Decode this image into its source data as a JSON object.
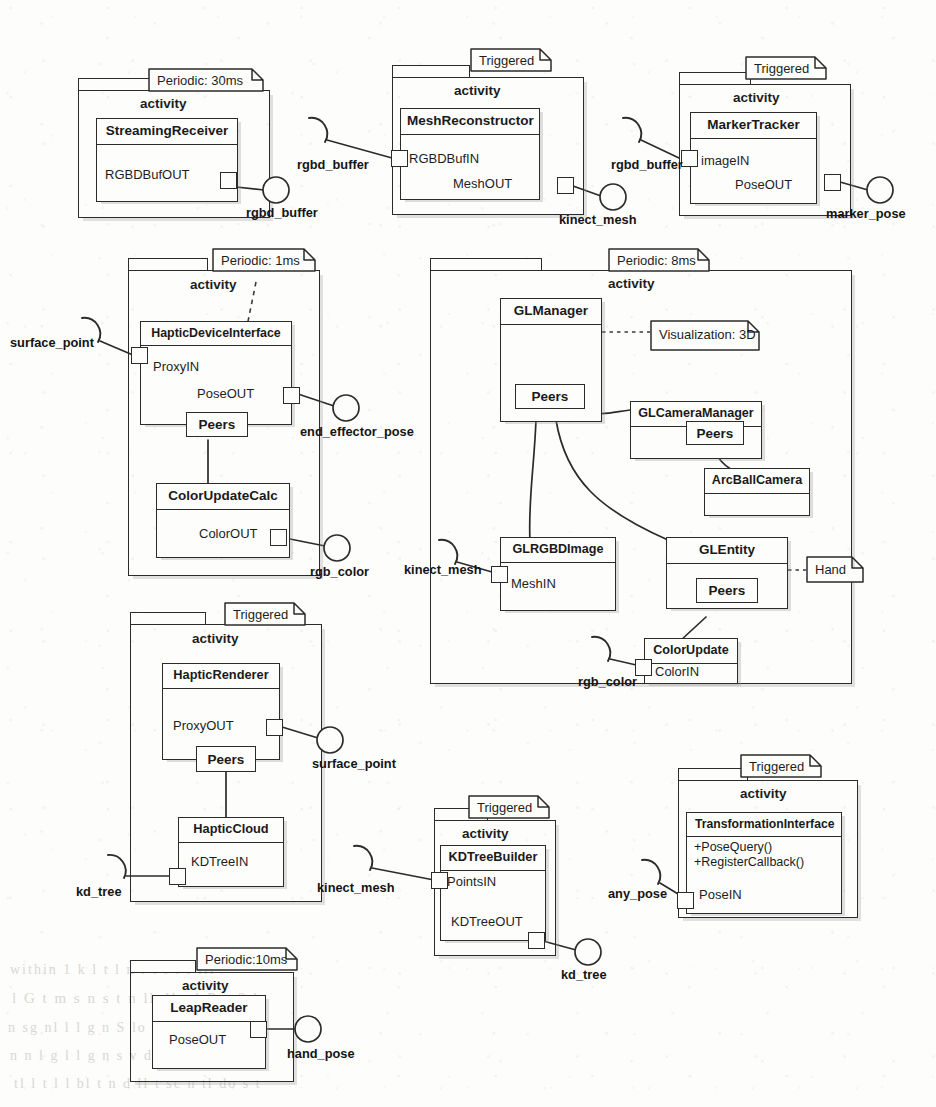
{
  "diagram": {
    "stereotype_label": "activity",
    "colors": {
      "line": "#2b2b2b",
      "text": "#1a1a1a",
      "paper": "#fdfdfc",
      "shadow": "#969696"
    }
  },
  "notes": {
    "periodic_30ms": "Periodic: 30ms",
    "triggered_mesh": "Triggered",
    "triggered_marker": "Triggered",
    "periodic_1ms": "Periodic: 1ms",
    "periodic_8ms": "Periodic: 8ms",
    "triggered_haptic": "Triggered",
    "triggered_kdtree": "Triggered",
    "triggered_transform": "Triggered",
    "periodic_10ms": "Periodic:10ms",
    "visualization_3d": "Visualization: 3D",
    "hand": "Hand"
  },
  "packages": [
    {
      "id": "pkg_streaming",
      "label": "activity"
    },
    {
      "id": "pkg_mesh",
      "label": "activity"
    },
    {
      "id": "pkg_marker",
      "label": "activity"
    },
    {
      "id": "pkg_haptic_dev",
      "label": "activity"
    },
    {
      "id": "pkg_gl",
      "label": "activity"
    },
    {
      "id": "pkg_haptic_rend",
      "label": "activity"
    },
    {
      "id": "pkg_kdtree",
      "label": "activity"
    },
    {
      "id": "pkg_transform",
      "label": "activity"
    },
    {
      "id": "pkg_leap",
      "label": "activity"
    }
  ],
  "classes": {
    "streaming_receiver": {
      "name": "StreamingReceiver",
      "ports": [
        "RGBDBufOUT"
      ]
    },
    "mesh_reconstructor": {
      "name": "MeshReconstructor",
      "ports": [
        "RGBDBufIN",
        "MeshOUT"
      ]
    },
    "marker_tracker": {
      "name": "MarkerTracker",
      "ports": [
        "imageIN",
        "PoseOUT"
      ]
    },
    "haptic_device_interface": {
      "name": "HapticDeviceInterface",
      "ports": [
        "ProxyIN",
        "PoseOUT"
      ],
      "peers": "Peers"
    },
    "color_update_calc": {
      "name": "ColorUpdateCalc",
      "ports": [
        "ColorOUT"
      ]
    },
    "gl_manager": {
      "name": "GLManager",
      "ports": [],
      "peers": "Peers"
    },
    "gl_camera_manager": {
      "name": "GLCameraManager",
      "ports": [],
      "peers": "Peers"
    },
    "arc_ball_camera": {
      "name": "ArcBallCamera",
      "ports": []
    },
    "gl_rgbd_image": {
      "name": "GLRGBDImage",
      "ports": [
        "MeshIN"
      ]
    },
    "gl_entity": {
      "name": "GLEntity",
      "ports": [],
      "peers": "Peers"
    },
    "color_update": {
      "name": "ColorUpdate",
      "ports": [
        "ColorIN"
      ]
    },
    "haptic_renderer": {
      "name": "HapticRenderer",
      "ports": [
        "ProxyOUT"
      ],
      "peers": "Peers"
    },
    "haptic_cloud": {
      "name": "HapticCloud",
      "ports": [
        "KDTreeIN"
      ]
    },
    "kdtree_builder": {
      "name": "KDTreeBuilder",
      "ports": [
        "PointsIN",
        "KDTreeOUT"
      ]
    },
    "transformation_interface": {
      "name": "TransformationInterface",
      "ports": [
        "PoseIN"
      ],
      "operations": [
        "+PoseQuery()",
        "+RegisterCallback()"
      ]
    },
    "leap_reader": {
      "name": "LeapReader",
      "ports": [
        "PoseOUT"
      ]
    }
  },
  "interfaces": {
    "rgbd_buffer_provided": "rgbd_buffer",
    "rgbd_buffer_req_mesh": "rgbd_buffer",
    "rgbd_buffer_req_marker": "rgbd_buffer",
    "kinect_mesh_provided": "kinect_mesh",
    "kinect_mesh_req_gl": "kinect_mesh",
    "kinect_mesh_req_kd": "kinect_mesh",
    "marker_pose": "marker_pose",
    "surface_point_req": "surface_point",
    "surface_point_prov": "surface_point",
    "end_effector_pose": "end_effector_pose",
    "rgb_color_provided": "rgb_color",
    "rgb_color_required": "rgb_color",
    "kd_tree_required": "kd_tree",
    "kd_tree_provided": "kd_tree",
    "any_pose": "any_pose",
    "hand_pose": "hand_pose"
  },
  "bleed_text": [
    "within  1 k l t   l  n   l   t    l t l    lli",
    "l G   t   m s  n  s t n  lloll   t  l   P g     2 l",
    "n  sg nl   l   l   g n    S   lo    s i n    t    n",
    "n  n  l   g   l  l g n    s v   d d  t  n  t   d  l lt",
    "tl l t l  l bl t  n d  ll  t  sc n tl  do   s  t   "
  ]
}
